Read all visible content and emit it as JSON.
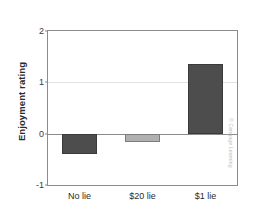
{
  "chart_data": {
    "type": "bar",
    "title": "",
    "xlabel": "",
    "ylabel": "Enjoyment rating",
    "categories": [
      "No lie",
      "$20 lie",
      "$1 lie"
    ],
    "values": [
      -0.4,
      -0.17,
      1.35
    ],
    "bar_colors": [
      "#4d4d4d",
      "#b0b0b0",
      "#4d4d4d"
    ],
    "ylim": [
      -1,
      2
    ],
    "yticks": [
      2,
      1,
      0,
      -1
    ],
    "ytick_labels": [
      "2",
      "1",
      "0",
      "-1"
    ],
    "gridlines": [
      1
    ],
    "zero_line": 0,
    "grid": true,
    "legend": "none",
    "series": [
      {
        "name": "Enjoyment rating",
        "values": [
          -0.4,
          -0.17,
          1.35
        ]
      }
    ]
  },
  "credit": {
    "text": "© Cengage Learning"
  }
}
